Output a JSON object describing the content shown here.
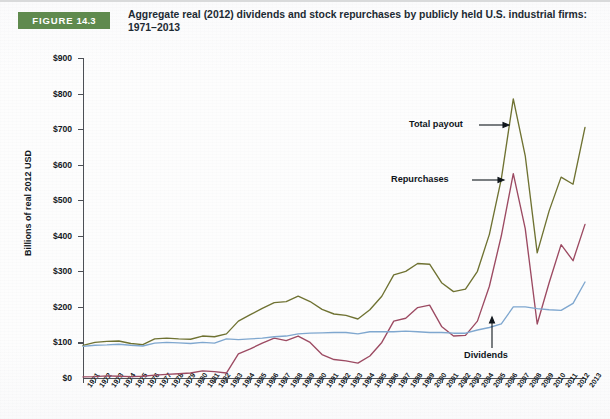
{
  "figure": {
    "badge_prefix": "FIGURE",
    "badge_number": "14.3",
    "title": "Aggregate real (2012) dividends and stock repurchases by publicly held U.S. industrial firms: 1971–2013"
  },
  "colors": {
    "badge_green": "#5f8a4e",
    "total_payout": "#6f7232",
    "repurchases": "#9c4a62",
    "dividends": "#7fa7cf",
    "axis": "#4c4f55",
    "text": "#14191e"
  },
  "annotations": {
    "total_payout": "Total payout",
    "repurchases": "Repurchases",
    "dividends": "Dividends"
  },
  "chart_data": {
    "type": "line",
    "title": "Aggregate real (2012) dividends and stock repurchases by publicly held U.S. industrial firms: 1971–2013",
    "xlabel": "",
    "ylabel": "Billions of real 2012 USD",
    "ylim": [
      0,
      900
    ],
    "yticks": [
      0,
      100,
      200,
      300,
      400,
      500,
      600,
      700,
      800,
      900
    ],
    "ytick_labels": [
      "$0",
      "$100",
      "$200",
      "$300",
      "$400",
      "$500",
      "$600",
      "$700",
      "$800",
      "$900"
    ],
    "grid": false,
    "legend_position": "inline-annotations",
    "x": [
      1971,
      1972,
      1973,
      1974,
      1975,
      1976,
      1977,
      1978,
      1979,
      1980,
      1981,
      1982,
      1983,
      1984,
      1985,
      1986,
      1987,
      1988,
      1989,
      1990,
      1991,
      1992,
      1993,
      1994,
      1995,
      1996,
      1997,
      1998,
      1999,
      2000,
      2001,
      2002,
      2003,
      2004,
      2005,
      2006,
      2007,
      2008,
      2009,
      2010,
      2011,
      2012,
      2013
    ],
    "x_labels": [
      "1971",
      "1972",
      "1973",
      "1974",
      "1975",
      "1976",
      "1977",
      "1978",
      "1979",
      "1980",
      "1981",
      "1982",
      "1983",
      "1984",
      "1985",
      "1986",
      "1987",
      "1988",
      "1989",
      "1990",
      "1991",
      "1992",
      "1993",
      "1994",
      "1995",
      "1996",
      "1997",
      "1998",
      "1999",
      "2000",
      "2001",
      "2002",
      "2003",
      "2004",
      "2005",
      "2006",
      "2007",
      "2008",
      "2009",
      "2010",
      "2011",
      "2012",
      "2013"
    ],
    "series": [
      {
        "name": "Total payout",
        "color": "#6f7232",
        "values": [
          92,
          100,
          103,
          104,
          97,
          94,
          110,
          112,
          110,
          109,
          118,
          116,
          124,
          160,
          178,
          196,
          212,
          215,
          230,
          215,
          193,
          180,
          176,
          166,
          192,
          230,
          290,
          300,
          322,
          320,
          268,
          243,
          250,
          300,
          404,
          560,
          785,
          625,
          352,
          470,
          565,
          545,
          705
        ]
      },
      {
        "name": "Repurchases",
        "color": "#9c4a62",
        "values": [
          3,
          4,
          6,
          5,
          4,
          5,
          8,
          10,
          12,
          14,
          20,
          18,
          14,
          68,
          82,
          98,
          112,
          105,
          118,
          100,
          66,
          52,
          48,
          42,
          62,
          100,
          160,
          168,
          198,
          205,
          145,
          118,
          120,
          160,
          258,
          400,
          575,
          420,
          152,
          268,
          375,
          330,
          432
        ]
      },
      {
        "name": "Dividends",
        "color": "#7fa7cf",
        "values": [
          89,
          92,
          93,
          95,
          92,
          90,
          98,
          100,
          99,
          97,
          100,
          98,
          110,
          108,
          110,
          112,
          116,
          118,
          124,
          126,
          127,
          128,
          128,
          124,
          130,
          130,
          130,
          132,
          130,
          128,
          128,
          126,
          126,
          135,
          142,
          152,
          200,
          200,
          195,
          192,
          190,
          210,
          270
        ]
      }
    ],
    "annotations": [
      {
        "text": "Total payout",
        "points_to_series": "Total payout",
        "near_year": 2006
      },
      {
        "text": "Repurchases",
        "points_to_series": "Repurchases",
        "near_year": 2006
      },
      {
        "text": "Dividends",
        "points_to_series": "Dividends",
        "near_year": 2007
      }
    ]
  }
}
